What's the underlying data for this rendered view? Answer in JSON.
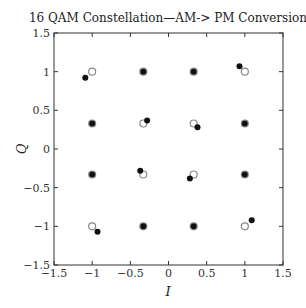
{
  "chart_data": {
    "type": "scatter",
    "title": "16 QAM Constellation—AM-> PM Conversion",
    "xlabel": "I",
    "ylabel": "Q",
    "xlim": [
      -1.5,
      1.5
    ],
    "ylim": [
      -1.5,
      1.5
    ],
    "xticks": [
      -1.5,
      -1,
      -0.5,
      0,
      0.5,
      1,
      1.5
    ],
    "xtick_labels": [
      "−1.5",
      "−1",
      "−0.5",
      "0",
      "0.5",
      "1",
      "1.5"
    ],
    "yticks": [
      -1.5,
      -1,
      -0.5,
      0,
      0.5,
      1,
      1.5
    ],
    "ytick_labels": [
      "−1.5",
      "−1",
      "−0.5",
      "0",
      "0.5",
      "1",
      "1.5"
    ],
    "grid": false,
    "legend": null,
    "series": [
      {
        "name": "ideal",
        "marker": "open-circle",
        "color": "#888888",
        "points": [
          [
            -1,
            1
          ],
          [
            -0.33,
            1
          ],
          [
            0.33,
            1
          ],
          [
            1,
            1
          ],
          [
            -1,
            0.33
          ],
          [
            -0.33,
            0.33
          ],
          [
            0.33,
            0.33
          ],
          [
            1,
            0.33
          ],
          [
            -1,
            -0.33
          ],
          [
            -0.33,
            -0.33
          ],
          [
            0.33,
            -0.33
          ],
          [
            1,
            -0.33
          ],
          [
            -1,
            -1
          ],
          [
            -0.33,
            -1
          ],
          [
            0.33,
            -1
          ],
          [
            1,
            -1
          ]
        ]
      },
      {
        "name": "received (AM-PM distorted)",
        "marker": "filled-dot",
        "color": "#111111",
        "points": [
          [
            -1.09,
            0.92
          ],
          [
            -0.33,
            1
          ],
          [
            0.33,
            1
          ],
          [
            0.93,
            1.07
          ],
          [
            -1,
            0.33
          ],
          [
            -0.28,
            0.37
          ],
          [
            0.38,
            0.28
          ],
          [
            1,
            0.33
          ],
          [
            -1,
            -0.33
          ],
          [
            -0.37,
            -0.28
          ],
          [
            0.28,
            -0.38
          ],
          [
            1,
            -0.33
          ],
          [
            -0.93,
            -1.07
          ],
          [
            -0.33,
            -1
          ],
          [
            0.33,
            -1
          ],
          [
            1.09,
            -0.92
          ]
        ]
      }
    ]
  }
}
